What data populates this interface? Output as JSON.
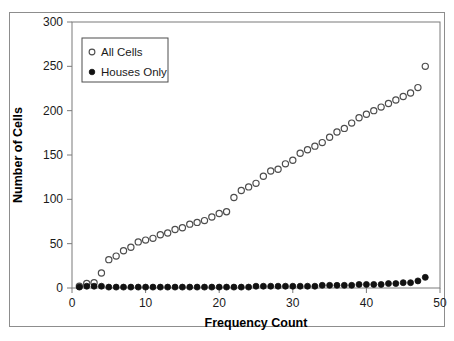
{
  "chart_data": {
    "type": "scatter",
    "title": "",
    "xlabel": "Frequency Count",
    "ylabel": "Number of Cells",
    "xlim": [
      0,
      50
    ],
    "ylim": [
      0,
      300
    ],
    "xticks": [
      0,
      10,
      20,
      30,
      40,
      50
    ],
    "yticks": [
      0,
      50,
      100,
      150,
      200,
      250,
      300
    ],
    "xtick_labels": [
      "0",
      "10",
      "20",
      "30",
      "40",
      "50"
    ],
    "ytick_labels": [
      "0",
      "50",
      "100",
      "150",
      "200",
      "250",
      "300"
    ],
    "grid": false,
    "legend_position": "top-left-inside",
    "series": [
      {
        "name": "All Cells",
        "marker": "open-circle",
        "color": "#4d4d4d",
        "x": [
          1,
          2,
          3,
          4,
          5,
          6,
          7,
          8,
          9,
          10,
          11,
          12,
          13,
          14,
          15,
          16,
          17,
          18,
          19,
          20,
          21,
          22,
          23,
          24,
          25,
          26,
          27,
          28,
          29,
          30,
          31,
          32,
          33,
          34,
          35,
          36,
          37,
          38,
          39,
          40,
          41,
          42,
          43,
          44,
          45,
          46,
          47,
          48
        ],
        "values": [
          2,
          5,
          6,
          17,
          32,
          36,
          42,
          46,
          52,
          54,
          56,
          60,
          62,
          66,
          68,
          72,
          74,
          76,
          80,
          84,
          86,
          102,
          110,
          114,
          118,
          126,
          132,
          134,
          140,
          144,
          152,
          156,
          160,
          164,
          170,
          176,
          180,
          186,
          192,
          196,
          200,
          204,
          208,
          212,
          216,
          220,
          226,
          250
        ]
      },
      {
        "name": "Houses Only",
        "marker": "filled-circle",
        "color": "#111111",
        "x": [
          1,
          2,
          3,
          4,
          5,
          6,
          7,
          8,
          9,
          10,
          11,
          12,
          13,
          14,
          15,
          16,
          17,
          18,
          19,
          20,
          21,
          22,
          23,
          24,
          25,
          26,
          27,
          28,
          29,
          30,
          31,
          32,
          33,
          34,
          35,
          36,
          37,
          38,
          39,
          40,
          41,
          42,
          43,
          44,
          45,
          46,
          47,
          48
        ],
        "values": [
          1,
          2,
          2,
          2,
          1,
          1,
          1,
          1,
          1,
          1,
          1,
          1,
          1,
          1,
          1,
          1,
          1,
          1,
          1,
          1,
          1,
          1,
          1,
          1,
          2,
          2,
          2,
          2,
          2,
          2,
          2,
          2,
          2,
          3,
          3,
          3,
          3,
          3,
          4,
          4,
          4,
          4,
          5,
          5,
          6,
          6,
          8,
          12
        ]
      }
    ]
  },
  "legend": {
    "entries": [
      {
        "label": "All Cells",
        "marker": "open-circle"
      },
      {
        "label": "Houses Only",
        "marker": "filled-circle"
      }
    ]
  },
  "axes": {
    "x_title": "Frequency Count",
    "y_title": "Number of Cells"
  }
}
